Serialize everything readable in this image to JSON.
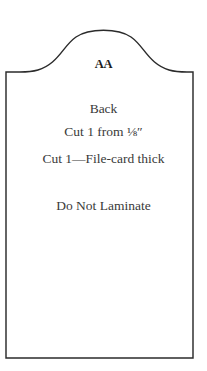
{
  "document": {
    "kind": "pattern-template",
    "shape": "arched-ogee-rectangle",
    "colors": {
      "background": "#ffffff",
      "outline": "#2b2b2b",
      "text": "#3a3a3a",
      "label_text": "#1d1d1d"
    }
  },
  "pattern": {
    "part_label": "AA",
    "lines": [
      {
        "id": "back",
        "text": "Back"
      },
      {
        "id": "cut-1",
        "text": "Cut 1 from  ⅛″"
      },
      {
        "id": "cut-2",
        "text": "Cut 1—File-card thick"
      },
      {
        "id": "laminate",
        "text": "Do Not Laminate"
      }
    ],
    "part_name": "Back",
    "cut_instruction_thickness": "Cut 1 from  ⅛″",
    "cut_instruction_material": "Cut 1—File-card thick",
    "lamination_note": "Do Not Laminate"
  }
}
